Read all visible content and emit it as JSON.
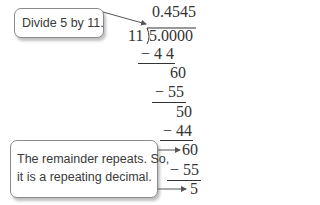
{
  "callouts": {
    "top": "Divide 5 by 11.",
    "bottom_line1": "The remainder repeats. So,",
    "bottom_line2": "it is a repeating decimal."
  },
  "division": {
    "quotient": "0.4545",
    "divisor": "11",
    "dividend": "5.0000",
    "steps": [
      {
        "type": "subtract",
        "text": "− 4 4"
      },
      {
        "type": "remainder",
        "text": "60"
      },
      {
        "type": "subtract",
        "text": "− 55"
      },
      {
        "type": "remainder",
        "text": "50"
      },
      {
        "type": "subtract",
        "text": "− 44"
      },
      {
        "type": "remainder",
        "text": "60",
        "highlighted": true
      },
      {
        "type": "subtract",
        "text": "− 55"
      },
      {
        "type": "remainder",
        "text": "5",
        "highlighted": true
      }
    ]
  },
  "colors": {
    "text": "#333333",
    "callout_border": "#8a8a8a",
    "arrow": "#555555"
  }
}
